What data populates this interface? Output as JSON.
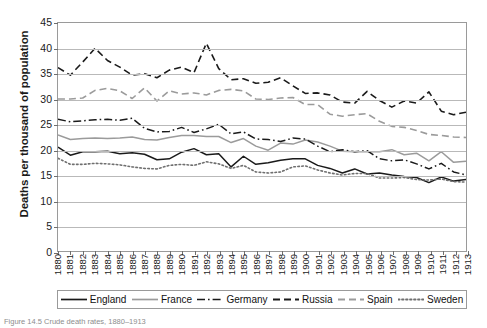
{
  "chart_data": {
    "type": "line",
    "title": "",
    "xlabel": "",
    "ylabel": "Deaths per thousand of population",
    "ylim": [
      0,
      45
    ],
    "ytick_values": [
      0,
      5,
      10,
      15,
      20,
      25,
      30,
      35,
      40,
      45
    ],
    "grid": true,
    "legend_position": "bottom",
    "x": [
      1880,
      1881,
      1882,
      1883,
      1884,
      1885,
      1886,
      1887,
      1888,
      1889,
      1890,
      1891,
      1892,
      1893,
      1894,
      1895,
      1896,
      1897,
      1898,
      1899,
      1900,
      1901,
      1902,
      1903,
      1904,
      1905,
      1906,
      1907,
      1908,
      1909,
      1910,
      1911,
      1912,
      1913
    ],
    "categories": [
      "1880",
      "1881",
      "1882",
      "1883",
      "1884",
      "1885",
      "1886",
      "1887",
      "1888",
      "1889",
      "1890",
      "1891",
      "1892",
      "1893",
      "1894",
      "1895",
      "1896",
      "1897",
      "1898",
      "1899",
      "1900",
      "1901",
      "1902",
      "1903",
      "1904",
      "1905",
      "1906",
      "1907",
      "1908",
      "1909",
      "1910",
      "1911",
      "1912",
      "1913"
    ],
    "series": [
      {
        "name": "England",
        "color": "#1a1a1a",
        "style": "solid",
        "values": [
          20.5,
          18.9,
          19.6,
          19.6,
          19.7,
          19.2,
          19.4,
          19.1,
          18.0,
          18.2,
          19.5,
          20.2,
          19.0,
          19.2,
          16.6,
          18.7,
          17.1,
          17.4,
          17.9,
          18.2,
          18.2,
          16.9,
          16.3,
          15.4,
          16.2,
          15.2,
          15.4,
          15.0,
          14.7,
          14.5,
          13.5,
          14.6,
          13.8,
          14.1
        ]
      },
      {
        "name": "France",
        "color": "#9b9b9b",
        "style": "solid",
        "values": [
          22.9,
          22.0,
          22.2,
          22.3,
          22.2,
          22.3,
          22.5,
          22.0,
          21.9,
          22.4,
          22.8,
          22.8,
          22.6,
          22.6,
          21.4,
          22.2,
          20.7,
          19.9,
          21.3,
          21.1,
          21.9,
          21.5,
          20.7,
          19.7,
          19.6,
          19.6,
          19.6,
          20.0,
          19.0,
          19.3,
          17.8,
          19.6,
          17.5,
          17.7
        ]
      },
      {
        "name": "Germany",
        "color": "#1a1a1a",
        "style": "dashdot",
        "values": [
          26.0,
          25.5,
          25.7,
          25.9,
          26.0,
          25.8,
          26.2,
          24.2,
          23.5,
          23.6,
          24.4,
          23.4,
          24.1,
          25.0,
          23.1,
          23.5,
          22.1,
          22.0,
          21.6,
          22.3,
          22.1,
          20.7,
          19.6,
          20.0,
          19.6,
          19.8,
          18.2,
          17.8,
          18.0,
          17.2,
          16.2,
          17.3,
          15.6,
          15.0
        ]
      },
      {
        "name": "Russia",
        "color": "#1a1a1a",
        "style": "dashed",
        "values": [
          36.2,
          34.7,
          37.3,
          40.0,
          37.6,
          36.3,
          34.7,
          35.0,
          34.2,
          35.7,
          36.3,
          35.2,
          41.0,
          36.0,
          33.8,
          34.0,
          33.1,
          33.3,
          34.2,
          32.6,
          31.1,
          31.2,
          30.8,
          29.4,
          29.2,
          31.5,
          29.7,
          28.4,
          29.6,
          29.2,
          31.4,
          27.6,
          26.9,
          27.4
        ]
      },
      {
        "name": "Spain",
        "color": "#9b9b9b",
        "style": "dashed",
        "values": [
          30.0,
          30.0,
          30.2,
          31.7,
          32.1,
          31.6,
          30.1,
          32.2,
          29.6,
          31.6,
          31.0,
          31.2,
          30.8,
          31.7,
          31.9,
          31.6,
          30.0,
          29.9,
          30.2,
          30.3,
          28.9,
          28.9,
          27.0,
          26.6,
          26.9,
          27.1,
          25.6,
          24.6,
          24.4,
          23.8,
          23.0,
          22.8,
          22.5,
          22.4
        ]
      },
      {
        "name": "Sweden",
        "color": "#6f6f6f",
        "style": "dotted",
        "values": [
          18.3,
          17.1,
          17.1,
          17.3,
          17.2,
          17.0,
          16.6,
          16.3,
          16.2,
          16.9,
          17.1,
          16.9,
          17.6,
          17.2,
          16.3,
          16.9,
          15.6,
          15.4,
          15.6,
          16.6,
          16.8,
          16.0,
          15.4,
          15.0,
          15.3,
          15.3,
          14.4,
          14.4,
          14.5,
          14.1,
          14.0,
          14.2,
          13.7,
          13.6
        ]
      }
    ]
  },
  "legend": {
    "items": [
      {
        "label": "England"
      },
      {
        "label": "France"
      },
      {
        "label": "Germany"
      },
      {
        "label": "Russia"
      },
      {
        "label": "Spain"
      },
      {
        "label": "Sweden"
      }
    ]
  },
  "caption": {
    "text": "Figure 14.5 Crude death rates, 1880–1913"
  }
}
